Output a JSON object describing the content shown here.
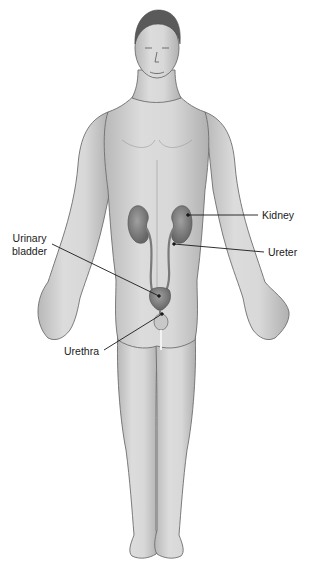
{
  "diagram": {
    "colors": {
      "skin_fill": "#d4d4d4",
      "skin_shadow": "#a9a9a9",
      "outline": "#6e6e6e",
      "organ_fill": "#8a8a8a",
      "organ_dark": "#6a6a6a",
      "hair": "#5a5a5a",
      "leader_line": "#1a1a1a",
      "label_text": "#1a1a1a"
    },
    "labels": {
      "kidney": "Kidney",
      "ureter": "Ureter",
      "urinary_bladder_line1": "Urinary",
      "urinary_bladder_line2": "bladder",
      "urethra": "Urethra"
    }
  }
}
